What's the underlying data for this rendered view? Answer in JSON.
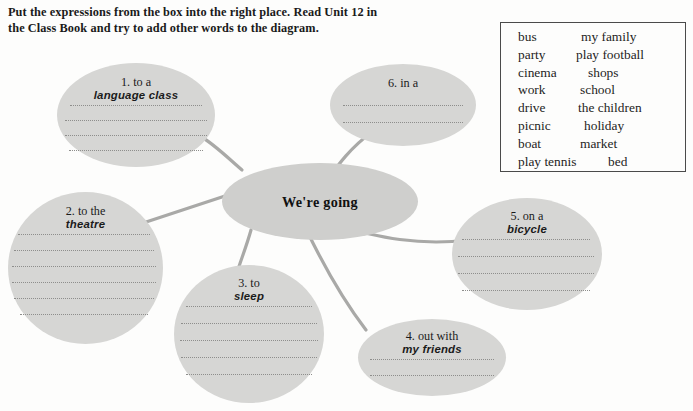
{
  "instructions": {
    "line1": "Put the expressions from the box into the right place. Read Unit 12 in",
    "line2": "the Class Book and try to add other words to the diagram."
  },
  "word_box": {
    "rows": [
      {
        "left": "bus",
        "right": "my family"
      },
      {
        "left": "party",
        "right": "play football"
      },
      {
        "left": "cinema",
        "right": "shops"
      },
      {
        "left": "work",
        "right": "school"
      },
      {
        "left": "drive",
        "right": "the children"
      },
      {
        "left": "picnic",
        "right": "holiday"
      },
      {
        "left": "boat",
        "right": "market"
      },
      {
        "left": "play tennis",
        "right": "bed"
      }
    ]
  },
  "diagram": {
    "center_label": "We're going",
    "fill_color": "#d6d6d4",
    "line_color": "#a8a8a6",
    "branches": [
      {
        "id": 1,
        "title": "1. to a",
        "answer": "language class",
        "rules": 4
      },
      {
        "id": 2,
        "title": "2. to the",
        "answer": "theatre",
        "rules": 6
      },
      {
        "id": 3,
        "title": "3. to",
        "answer": "sleep",
        "rules": 5
      },
      {
        "id": 4,
        "title": "4. out with",
        "answer": "my friends",
        "rules": 2
      },
      {
        "id": 5,
        "title": "5. on a",
        "answer": "bicycle",
        "rules": 4
      },
      {
        "id": 6,
        "title": "6. in a",
        "answer": "",
        "rules": 2
      }
    ]
  }
}
